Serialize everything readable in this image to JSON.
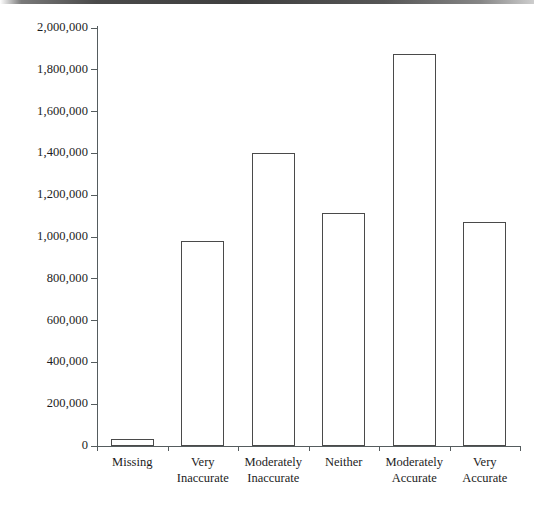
{
  "chart_data": {
    "type": "bar",
    "title": "",
    "subtitle": "",
    "xlabel": "",
    "ylabel": "",
    "categories": [
      "Missing",
      "Very Inaccurate",
      "Moderately Inaccurate",
      "Neither",
      "Moderately Accurate",
      "Very Accurate"
    ],
    "category_lines": [
      [
        "Missing"
      ],
      [
        "Very",
        "Inaccurate"
      ],
      [
        "Moderately",
        "Inaccurate"
      ],
      [
        "Neither"
      ],
      [
        "Moderately",
        "Accurate"
      ],
      [
        "Very",
        "Accurate"
      ]
    ],
    "values": [
      35000,
      980000,
      1400000,
      1115000,
      1875000,
      1070000
    ],
    "ylim": [
      0,
      2000000
    ],
    "ytick_values": [
      0,
      200000,
      400000,
      600000,
      800000,
      1000000,
      1200000,
      1400000,
      1600000,
      1800000,
      2000000
    ],
    "ytick_labels": [
      "0",
      "200,000",
      "400,000",
      "600,000",
      "800,000",
      "1,000,000",
      "1,200,000",
      "1,400,000",
      "1,600,000",
      "1,800,000",
      "2,000,000"
    ],
    "grid": false,
    "legend": null,
    "legend_position": "none",
    "bar_fill_color": "#ffffff",
    "bar_border_color": "#4a4a4a",
    "axis_color": "#555c5e",
    "background_color": "#ffffff",
    "text_color": "#1c1c1c"
  }
}
